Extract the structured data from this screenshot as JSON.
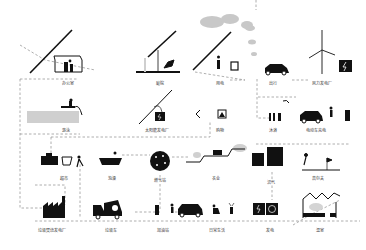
{
  "diagram": {
    "type": "flow-illustration",
    "colors": {
      "ink": "#111111",
      "dash": "#9a9a9a",
      "cloud": "#c8c8c8",
      "pool": "#cfcfcf",
      "background": "#ffffff"
    },
    "nodes": [
      {
        "id": "office",
        "label": "办公室",
        "x": 68,
        "y": 83
      },
      {
        "id": "garden",
        "label": "庭院",
        "x": 160,
        "y": 83
      },
      {
        "id": "power-use",
        "label": "用电",
        "x": 220,
        "y": 83
      },
      {
        "id": "travel",
        "label": "出行",
        "x": 273,
        "y": 83
      },
      {
        "id": "wind-plant",
        "label": "风力发电厂",
        "x": 322,
        "y": 83
      },
      {
        "id": "pool",
        "label": "游泳",
        "x": 66,
        "y": 130
      },
      {
        "id": "solar-plant",
        "label": "太阳能发电厂",
        "x": 157,
        "y": 130
      },
      {
        "id": "shopping-goods",
        "label": "购物",
        "x": 220,
        "y": 130
      },
      {
        "id": "shower",
        "label": "沐浴",
        "x": 273,
        "y": 130
      },
      {
        "id": "ev-charging",
        "label": "电动车充电",
        "x": 316,
        "y": 130
      },
      {
        "id": "supermarket",
        "label": "超市",
        "x": 64,
        "y": 178
      },
      {
        "id": "bath",
        "label": "泡澡",
        "x": 112,
        "y": 178
      },
      {
        "id": "gas-station-node",
        "label": "燃气站",
        "x": 160,
        "y": 180
      },
      {
        "id": "farming",
        "label": "农业",
        "x": 216,
        "y": 178
      },
      {
        "id": "biogas",
        "label": "沼气",
        "x": 271,
        "y": 182
      },
      {
        "id": "golf",
        "label": "高尔夫",
        "x": 318,
        "y": 178
      },
      {
        "id": "waste-plant",
        "label": "垃圾焚烧发电厂",
        "x": 52,
        "y": 230
      },
      {
        "id": "garbage-truck",
        "label": "垃圾车",
        "x": 111,
        "y": 230
      },
      {
        "id": "fuel-station",
        "label": "加油站",
        "x": 163,
        "y": 230
      },
      {
        "id": "daily-life",
        "label": "日常生活",
        "x": 217,
        "y": 230
      },
      {
        "id": "electricity",
        "label": "发电",
        "x": 270,
        "y": 230
      },
      {
        "id": "greenhouse",
        "label": "温室",
        "x": 320,
        "y": 230
      }
    ]
  }
}
